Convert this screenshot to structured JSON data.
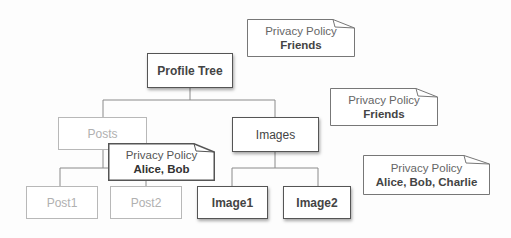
{
  "diagram": {
    "nodes": {
      "root": {
        "label": "Profile Tree",
        "state": "active"
      },
      "posts": {
        "label": "Posts",
        "state": "inactive"
      },
      "images": {
        "label": "Images",
        "state": "active"
      },
      "post1": {
        "label": "Post1",
        "state": "inactive"
      },
      "post2": {
        "label": "Post2",
        "state": "inactive"
      },
      "image1": {
        "label": "Image1",
        "state": "active"
      },
      "image2": {
        "label": "Image2",
        "state": "active"
      }
    },
    "notes": {
      "root_policy": {
        "title": "Privacy Policy",
        "value": "Friends"
      },
      "images_policy": {
        "title": "Privacy Policy",
        "value": "Friends"
      },
      "posts_policy": {
        "title": "Privacy Policy",
        "value": "Alice, Bob"
      },
      "image_children_policy": {
        "title": "Privacy Policy",
        "value": "Alice, Bob, Charlie"
      }
    },
    "colors": {
      "active_border": "#555555",
      "inactive_border": "#b8b8b8",
      "active_text": "#444444",
      "inactive_text": "#b0b0b0",
      "connector": "#8a8a8a"
    }
  }
}
